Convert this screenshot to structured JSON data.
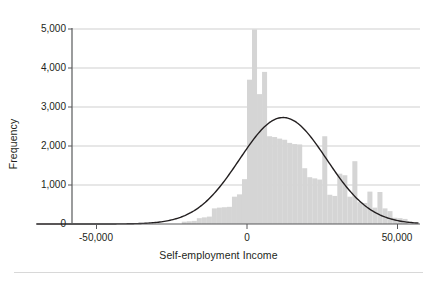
{
  "chart_data": {
    "type": "bar",
    "title": "",
    "subtitle": "",
    "xlabel": "Self-employment Income",
    "ylabel": "Frequency",
    "xlim": [
      -70000,
      57000
    ],
    "ylim": [
      0,
      5000
    ],
    "grid": true,
    "legend": null,
    "x_ticks": [
      -50000,
      0,
      50000
    ],
    "x_tick_labels": [
      "-50,000",
      "0",
      "50,000"
    ],
    "y_ticks": [
      0,
      1000,
      2000,
      3000,
      4000,
      5000
    ],
    "y_tick_labels": [
      "0",
      "1,000",
      "2,000",
      "3,000",
      "4,000",
      "5,000"
    ],
    "bar_color": "#d5d5d5",
    "curve_color": "#231f20",
    "axis_color": "#58595b",
    "grid_color": "#c9c9c9",
    "bin_width": 1667,
    "bins": [
      {
        "x": -20833,
        "value": 60
      },
      {
        "x": -19167,
        "value": 70
      },
      {
        "x": -17500,
        "value": 80
      },
      {
        "x": -15833,
        "value": 150
      },
      {
        "x": -14167,
        "value": 170
      },
      {
        "x": -12500,
        "value": 190
      },
      {
        "x": -10833,
        "value": 400
      },
      {
        "x": -9167,
        "value": 420
      },
      {
        "x": -7500,
        "value": 430
      },
      {
        "x": -5833,
        "value": 440
      },
      {
        "x": -4167,
        "value": 700
      },
      {
        "x": -2500,
        "value": 760
      },
      {
        "x": -833,
        "value": 1150
      },
      {
        "x": 833,
        "value": 3700
      },
      {
        "x": 2500,
        "value": 4990
      },
      {
        "x": 4167,
        "value": 3330
      },
      {
        "x": 5833,
        "value": 3900
      },
      {
        "x": 7500,
        "value": 2250
      },
      {
        "x": 9167,
        "value": 2230
      },
      {
        "x": 10833,
        "value": 2190
      },
      {
        "x": 12500,
        "value": 2160
      },
      {
        "x": 14167,
        "value": 2080
      },
      {
        "x": 15833,
        "value": 2050
      },
      {
        "x": 17500,
        "value": 2040
      },
      {
        "x": 19167,
        "value": 1430
      },
      {
        "x": 20833,
        "value": 1200
      },
      {
        "x": 22500,
        "value": 1170
      },
      {
        "x": 24167,
        "value": 1140
      },
      {
        "x": 25833,
        "value": 2250
      },
      {
        "x": 27500,
        "value": 750
      },
      {
        "x": 29167,
        "value": 720
      },
      {
        "x": 30833,
        "value": 1290
      },
      {
        "x": 32500,
        "value": 1250
      },
      {
        "x": 34167,
        "value": 700
      },
      {
        "x": 35833,
        "value": 1610
      },
      {
        "x": 37500,
        "value": 560
      },
      {
        "x": 39167,
        "value": 540
      },
      {
        "x": 40833,
        "value": 830
      },
      {
        "x": 42500,
        "value": 420
      },
      {
        "x": 44167,
        "value": 820
      },
      {
        "x": 45833,
        "value": 400
      },
      {
        "x": 47500,
        "value": 330
      },
      {
        "x": 49167,
        "value": 160
      },
      {
        "x": 50833,
        "value": 150
      },
      {
        "x": 52500,
        "value": 130
      }
    ],
    "normal_curve": {
      "label": "Normal curve",
      "peak_value": 2730,
      "mean": 12000,
      "std_dev": 14500,
      "visible": true
    }
  },
  "axes": {
    "y_title": "Frequency",
    "x_title": "Self-employment Income"
  }
}
